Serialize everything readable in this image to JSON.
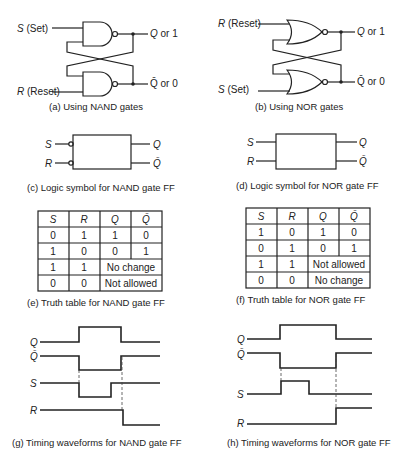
{
  "header": {
    "partial_title": "ENTS"
  },
  "panels": {
    "a": {
      "caption": "(a)  Using NAND gates",
      "in_top": "S",
      "in_top_note": "(Set)",
      "in_bot": "R",
      "in_bot_note": "(Reset)",
      "out_top": "Q or 1",
      "out_bot": "Q̄ or 0"
    },
    "b": {
      "caption": "(b)  Using NOR gates",
      "in_top": "R",
      "in_top_note": "(Reset)",
      "in_bot": "S",
      "in_bot_note": "(Set)",
      "out_top": "Q or 1",
      "out_bot": "Q̄ or 0"
    },
    "c": {
      "caption": "(c)  Logic symbol for NAND gate FF",
      "in1": "S",
      "in2": "R",
      "out1": "Q",
      "out2": "Q̄"
    },
    "d": {
      "caption": "(d)  Logic symbol for NOR gate FF",
      "in1": "S",
      "in2": "R",
      "out1": "Q",
      "out2": "Q̄"
    },
    "e": {
      "caption": "(e)  Truth table for NAND gate FF",
      "headers": [
        "S",
        "R",
        "Q",
        "Q̄"
      ],
      "rows": [
        [
          "0",
          "1",
          "1",
          "0"
        ],
        [
          "1",
          "0",
          "0",
          "1"
        ],
        [
          "1",
          "1",
          "No change"
        ],
        [
          "0",
          "0",
          "Not allowed"
        ]
      ]
    },
    "f": {
      "caption": "(f)  Truth table for NOR gate FF",
      "headers": [
        "S",
        "R",
        "Q",
        "Q̄"
      ],
      "rows": [
        [
          "1",
          "0",
          "1",
          "0"
        ],
        [
          "0",
          "1",
          "0",
          "1"
        ],
        [
          "1",
          "1",
          "Not allowed"
        ],
        [
          "0",
          "0",
          "No change"
        ]
      ]
    },
    "g": {
      "caption": "(g)  Timing waveforms for NAND gate FF",
      "signals": [
        "Q",
        "Q̄",
        "S",
        "R"
      ]
    },
    "h": {
      "caption": "(h)  Timing waveforms for NOR gate FF",
      "signals": [
        "Q",
        "Q̄",
        "S",
        "R"
      ]
    }
  }
}
